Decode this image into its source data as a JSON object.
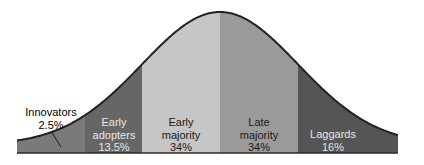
{
  "chart_data": {
    "type": "area",
    "title": "",
    "categories": [
      "Innovators",
      "Early adopters",
      "Early majority",
      "Late majority",
      "Laggards"
    ],
    "values": [
      2.5,
      13.5,
      34,
      34,
      16
    ],
    "value_labels": [
      "2.5%",
      "13.5%",
      "34%",
      "34%",
      "16%"
    ],
    "xlabel": "",
    "ylabel": "",
    "grid": false,
    "legend": "none"
  },
  "segments": [
    {
      "name": "Innovators",
      "line1": "Innovators",
      "line2": "2.5%",
      "color": "#7a7a7a",
      "text_color": "#1a1a1a"
    },
    {
      "name": "Early adopters",
      "line1": "Early",
      "line2": "adopters",
      "line3": "13.5%",
      "color": "#666666",
      "text_color": "#e6e6e6"
    },
    {
      "name": "Early majority",
      "line1": "Early",
      "line2": "majority",
      "line3": "34%",
      "color": "#c6c6c6",
      "text_color": "#1a1a1a"
    },
    {
      "name": "Late majority",
      "line1": "Late",
      "line2": "majority",
      "line3": "34%",
      "color": "#9a9a9a",
      "text_color": "#1a1a1a"
    },
    {
      "name": "Laggards",
      "line1": "Laggards",
      "line2": "16%",
      "color": "#555555",
      "text_color": "#e6e6e6"
    }
  ]
}
